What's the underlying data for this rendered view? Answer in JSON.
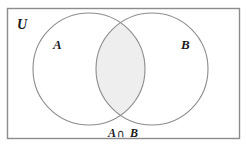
{
  "figure": {
    "type": "venn-diagram",
    "caption": "A ∩ B",
    "caption_parts": {
      "left_set": "A",
      "operator": "∩",
      "right_set": "B"
    },
    "universe": {
      "label": "U",
      "border_color": "#8c8c8c",
      "fill_color": "#ffffff"
    },
    "sets": [
      {
        "label": "A",
        "stroke_color": "#8c8c8c",
        "fill_color": "#ffffff"
      },
      {
        "label": "B",
        "stroke_color": "#8c8c8c",
        "fill_color": "#ffffff"
      }
    ],
    "shaded_region": {
      "name": "intersection",
      "label": "A ∩ B",
      "fill_color": "#eeeeee"
    }
  }
}
